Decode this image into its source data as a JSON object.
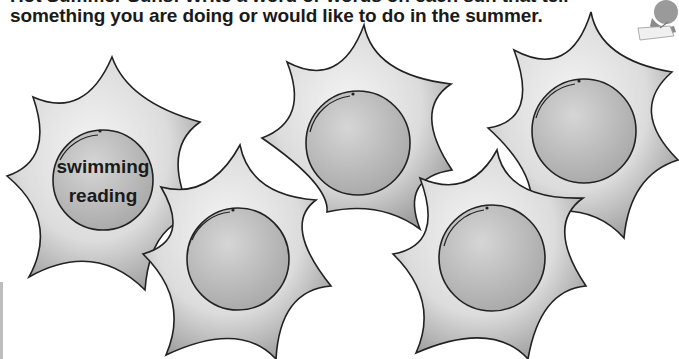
{
  "instructions": {
    "line1": "Hot Summer Suns! Write a word or words on each sun that tell",
    "line2": "something you are doing or would like to do in the summer."
  },
  "suns": [
    {
      "id": "sun-1",
      "words": [
        "swimming",
        "reading"
      ]
    },
    {
      "id": "sun-2",
      "words": []
    },
    {
      "id": "sun-3",
      "words": []
    },
    {
      "id": "sun-4",
      "words": []
    },
    {
      "id": "sun-5",
      "words": []
    }
  ],
  "clipart": {
    "icon": "person-writing-icon"
  },
  "colors": {
    "text": "#1a1a1a",
    "sun_fill": "#d9d9d9",
    "circle_fill": "#bfbfbf",
    "outline": "#222222"
  }
}
